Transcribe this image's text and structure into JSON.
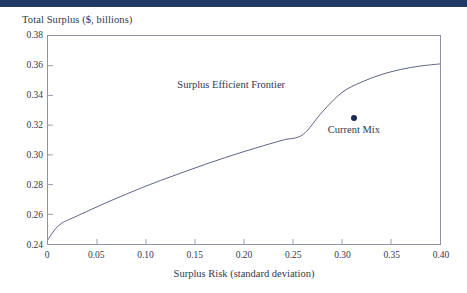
{
  "top_bar": {
    "color": "#1f3864"
  },
  "chart_data": {
    "type": "line",
    "title": "",
    "ylabel": "Total Surplus ($, billions)",
    "xlabel": "Surplus Risk (standard deviation)",
    "xlim": [
      0,
      0.4
    ],
    "ylim": [
      0.24,
      0.38
    ],
    "grid": false,
    "legend": "none",
    "line_color": "#4a5276",
    "x_ticks": [
      "0",
      "0.05",
      "0.10",
      "0.15",
      "0.20",
      "0.25",
      "0.30",
      "0.35",
      "0.40"
    ],
    "x_tick_values": [
      0,
      0.05,
      0.1,
      0.15,
      0.2,
      0.25,
      0.3,
      0.35,
      0.4
    ],
    "y_ticks": [
      "0.24",
      "0.26",
      "0.28",
      "0.30",
      "0.32",
      "0.34",
      "0.36",
      "0.38"
    ],
    "y_tick_values": [
      0.24,
      0.26,
      0.28,
      0.3,
      0.32,
      0.34,
      0.36,
      0.38
    ],
    "series": [
      {
        "name": "Surplus Efficient Frontier",
        "type": "line",
        "x": [
          0.0,
          0.004,
          0.008,
          0.012,
          0.016,
          0.02,
          0.03,
          0.04,
          0.05,
          0.06,
          0.07,
          0.08,
          0.09,
          0.1,
          0.12,
          0.14,
          0.16,
          0.18,
          0.2,
          0.22,
          0.24,
          0.26,
          0.28,
          0.3,
          0.32,
          0.34,
          0.36,
          0.38,
          0.4
        ],
        "y": [
          0.243,
          0.247,
          0.2505,
          0.253,
          0.2548,
          0.256,
          0.259,
          0.262,
          0.265,
          0.268,
          0.2708,
          0.2736,
          0.2763,
          0.279,
          0.284,
          0.2888,
          0.2935,
          0.298,
          0.3022,
          0.3062,
          0.31,
          0.3136,
          0.329,
          0.342,
          0.349,
          0.354,
          0.3575,
          0.3598,
          0.3612
        ]
      }
    ],
    "points": [
      {
        "name": "Current Mix",
        "label": "Current Mix",
        "x": 0.3105,
        "y": 0.3255,
        "color": "#1f2a52"
      }
    ],
    "annotations": [
      {
        "name": "Surplus Efficient Frontier",
        "text": "Surplus Efficient Frontier",
        "x": 0.186,
        "y": 0.3468
      }
    ]
  }
}
